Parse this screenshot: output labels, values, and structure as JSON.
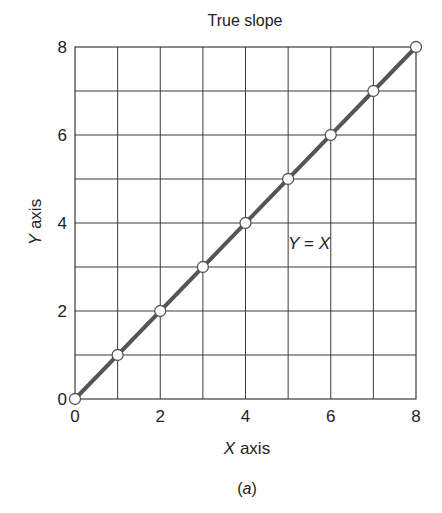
{
  "chart_data": {
    "type": "line",
    "title": "True slope",
    "xlabel": "X axis",
    "ylabel": "Y axis",
    "x_tick_labels": [
      "0",
      "2",
      "4",
      "6",
      "8"
    ],
    "y_tick_labels": [
      "0",
      "2",
      "4",
      "6",
      "8"
    ],
    "xlim": [
      0,
      8
    ],
    "ylim": [
      0,
      8
    ],
    "grid": true,
    "grid_step": 1,
    "legend": null,
    "series": [
      {
        "name": "Y = X",
        "x": [
          0,
          1,
          2,
          3,
          4,
          5,
          6,
          7,
          8
        ],
        "y": [
          0,
          1,
          2,
          3,
          4,
          5,
          6,
          7,
          8
        ],
        "marker": "open-circle",
        "color": "#555555"
      }
    ],
    "annotations": [
      {
        "text_prefix": "Y",
        "text_eq": " = ",
        "text_suffix": "X",
        "x": 5,
        "y": 4.5
      }
    ],
    "caption": "(a)"
  },
  "labels": {
    "title": "True slope",
    "xaxis_var": "X",
    "xaxis_word": " axis",
    "yaxis_var": "Y",
    "yaxis_word": " axis",
    "annotation_y": "Y",
    "annotation_eq": " = ",
    "annotation_x": "X",
    "caption_open": "(",
    "caption_letter": "a",
    "caption_close": ")"
  }
}
